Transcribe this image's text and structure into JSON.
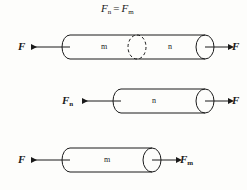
{
  "figure": {
    "title_equation": {
      "lhs_symbol": "F",
      "lhs_subscript": "n",
      "operator": "=",
      "rhs_symbol": "F",
      "rhs_subscript": "m"
    },
    "rows": [
      {
        "id": "combined-system",
        "left_force": {
          "symbol": "F",
          "subscript": ""
        },
        "right_force": {
          "symbol": "F",
          "subscript": ""
        },
        "bodies": [
          {
            "label": "m"
          },
          {
            "label": "n"
          }
        ],
        "divider": "dashed-ellipse"
      },
      {
        "id": "body-n-free-body",
        "left_force": {
          "symbol": "F",
          "subscript": "n"
        },
        "right_force": {
          "symbol": "F",
          "subscript": ""
        },
        "bodies": [
          {
            "label": "n"
          }
        ],
        "divider": "none"
      },
      {
        "id": "body-m-free-body",
        "left_force": {
          "symbol": "F",
          "subscript": ""
        },
        "right_force": {
          "symbol": "F",
          "subscript": "m"
        },
        "bodies": [
          {
            "label": "m"
          }
        ],
        "divider": "none"
      }
    ],
    "colors": {
      "stroke": "#1a1a1a",
      "background": "#fdfdfb",
      "text": "#1a1a1a"
    }
  }
}
